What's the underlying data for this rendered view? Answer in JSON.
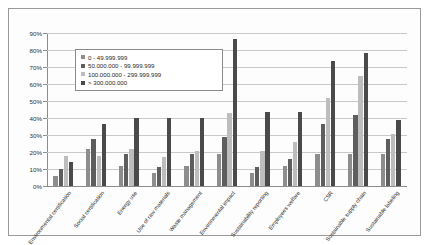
{
  "chart_data": {
    "type": "bar",
    "title": "",
    "xlabel": "",
    "ylabel": "",
    "ylim": [
      0,
      90
    ],
    "grid": true,
    "legend_position": "inside-top-left",
    "ytick_labels": [
      "90%",
      "80%",
      "70%",
      "60%",
      "50%",
      "40%",
      "30%",
      "20%",
      "10%",
      "0%"
    ],
    "ytick_values": [
      90,
      80,
      70,
      60,
      50,
      40,
      30,
      20,
      10,
      0
    ],
    "categories": [
      "Environmental certification",
      "Social certification",
      "Energy use",
      "Use of raw materials",
      "Waste management",
      "Environmental impact",
      "Sustainability reporting",
      "Employees welfare",
      "CSR",
      "Sustainable supply chain",
      "Sustainable labeling"
    ],
    "series": [
      {
        "name": "0 - 49.999.999",
        "color": "#8d8d8d",
        "values": [
          6,
          22,
          12,
          8,
          12,
          19,
          8,
          12,
          19,
          19,
          19
        ]
      },
      {
        "name": "50.000.000 - 99.999.999",
        "color": "#5e5e5e",
        "values": [
          10,
          28,
          19,
          11,
          19,
          29,
          11,
          16,
          37,
          42,
          28
        ]
      },
      {
        "name": "100.000.000 - 299.999.999",
        "color": "#bdbdbd",
        "values": [
          18,
          18,
          22,
          17,
          21,
          43,
          21,
          26,
          52,
          65,
          31
        ]
      },
      {
        "name": "> 300.000.000",
        "color": "#4a4a4a",
        "values": [
          14,
          37,
          40,
          40,
          40,
          87,
          44,
          44,
          74,
          79,
          39
        ]
      }
    ]
  },
  "legend": {
    "items": [
      {
        "marker": "legend-swatch",
        "label": "0 - 49.999.999"
      },
      {
        "marker": "legend-swatch",
        "label": "50.000.000 - 99.999.999"
      },
      {
        "marker": "legend-swatch",
        "label": "100.000.000 - 299.999.999"
      },
      {
        "marker": "legend-swatch",
        "label": "> 300.000.000"
      }
    ]
  }
}
